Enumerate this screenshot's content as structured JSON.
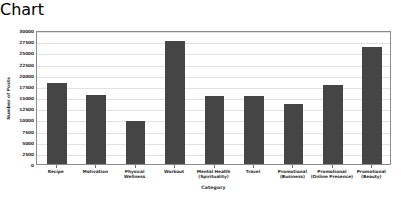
{
  "chart_data": {
    "type": "bar",
    "title": "",
    "xlabel": "Category",
    "ylabel": "Number of Posts",
    "categories": [
      "Recipe",
      "Motivation",
      "Physical\nWellness",
      "Workout",
      "Mental Health\n(Spirituality)",
      "Travel",
      "Promotional\n(Business)",
      "Promotional\n(Online Presence)",
      "Promotional\n(Beauty)"
    ],
    "values": [
      18200,
      15500,
      9700,
      27500,
      15300,
      15300,
      13500,
      17600,
      26300
    ],
    "ylim": [
      0,
      30000
    ],
    "yticks": [
      0,
      2500,
      5000,
      7500,
      10000,
      12500,
      15000,
      17500,
      20000,
      22500,
      25000,
      27500,
      30000
    ],
    "ytick_labels": [
      "0",
      "2500",
      "5000",
      "7500",
      "10000",
      "12500",
      "15000",
      "17500",
      "20000",
      "22500",
      "25000",
      "27500",
      "30000"
    ],
    "grid": true,
    "legend": false,
    "bar_color": "#454545",
    "grid_color": "#e2e2e2",
    "axis_color": "#8a8a8a",
    "background_color": "#ffffff",
    "text_color": "#2b2b2b"
  }
}
